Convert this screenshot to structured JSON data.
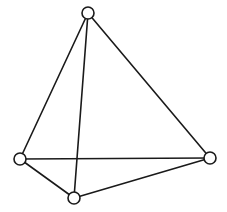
{
  "diagram": {
    "type": "graph",
    "style": {
      "stroke_color": "#1a1a1a",
      "node_fill": "#ffffff",
      "background": "#ffffff",
      "node_radius": 6
    },
    "nodes": [
      {
        "id": "top",
        "x": 88,
        "y": 13
      },
      {
        "id": "left",
        "x": 20,
        "y": 159
      },
      {
        "id": "right",
        "x": 210,
        "y": 158
      },
      {
        "id": "bottom",
        "x": 74,
        "y": 198
      }
    ],
    "edges": [
      {
        "from": "top",
        "to": "left"
      },
      {
        "from": "top",
        "to": "right"
      },
      {
        "from": "top",
        "to": "bottom"
      },
      {
        "from": "left",
        "to": "right"
      },
      {
        "from": "left",
        "to": "bottom"
      },
      {
        "from": "bottom",
        "to": "right"
      }
    ]
  }
}
